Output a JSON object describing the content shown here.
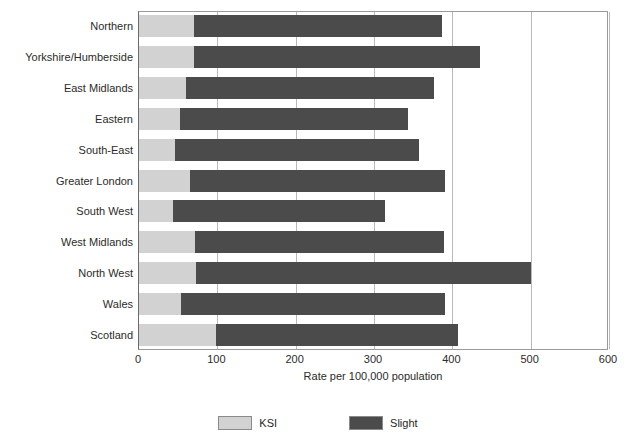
{
  "chart_data": {
    "type": "bar",
    "orientation": "horizontal",
    "stacked": true,
    "title": "",
    "xlabel": "Rate per 100,000 population",
    "ylabel": "",
    "xlim": [
      0,
      600
    ],
    "xticks": [
      0,
      100,
      200,
      300,
      400,
      500,
      600
    ],
    "grid": true,
    "legend_position": "bottom",
    "categories": [
      "Northern",
      "Yorkshire/Humberside",
      "East Midlands",
      "Eastern",
      "South-East",
      "Greater London",
      "South West",
      "West Midlands",
      "North West",
      "Wales",
      "Scotland"
    ],
    "series": [
      {
        "name": "KSI",
        "color": "#d2d2d2",
        "values": [
          70,
          70,
          60,
          52,
          46,
          65,
          43,
          72,
          73,
          54,
          98
        ]
      },
      {
        "name": "Slight",
        "color": "#4b4b4b",
        "values": [
          317,
          365,
          317,
          292,
          312,
          326,
          271,
          318,
          427,
          337,
          309
        ]
      }
    ],
    "totals": [
      387,
      435,
      377,
      344,
      358,
      391,
      314,
      390,
      500,
      391,
      407
    ]
  },
  "legend": {
    "items": [
      {
        "label": "KSI",
        "swatch": "ksi"
      },
      {
        "label": "Slight",
        "swatch": "slight"
      }
    ]
  },
  "axis": {
    "x_title": "Rate per 100,000 population",
    "tick_labels": [
      "0",
      "100",
      "200",
      "300",
      "400",
      "500",
      "600"
    ]
  },
  "colors": {
    "ksi": "#d2d2d2",
    "slight": "#4b4b4b",
    "gridline": "#b9b9b9",
    "axis": "#6a6a6a",
    "text": "#2b2b2b"
  }
}
